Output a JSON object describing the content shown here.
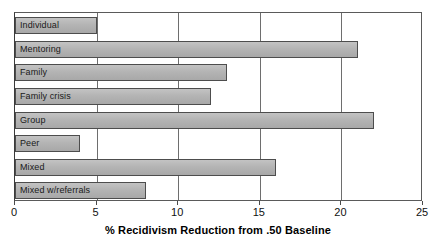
{
  "chart_data": {
    "type": "bar",
    "orientation": "horizontal",
    "title": "",
    "xlabel": "% Recidivism Reduction from .50 Baseline",
    "ylabel": "",
    "xlim": [
      0,
      25
    ],
    "xticks": [
      0,
      5,
      10,
      15,
      20,
      25
    ],
    "xtick_labels": [
      "0",
      "5",
      "10",
      "15",
      "20",
      "25"
    ],
    "grid": "vertical",
    "legend": "none",
    "categories": [
      "Individual",
      "Mentoring",
      "Family",
      "Family crisis",
      "Group",
      "Peer",
      "Mixed",
      "Mixed w/referrals"
    ],
    "values": [
      5,
      21,
      13,
      12,
      22,
      4,
      16,
      8
    ],
    "series": [
      {
        "name": "% Recidivism Reduction from .50 Baseline",
        "values": [
          5,
          21,
          13,
          12,
          22,
          4,
          16,
          8
        ]
      }
    ],
    "bar_fill_color": "#b4b4b4",
    "bar_border_color": "#4d4d4d",
    "gridline_color": "#6e6e6e",
    "axis_color": "#4a4a4a",
    "background_color": "#ffffff",
    "label_placement": "inside-left-of-bar"
  }
}
